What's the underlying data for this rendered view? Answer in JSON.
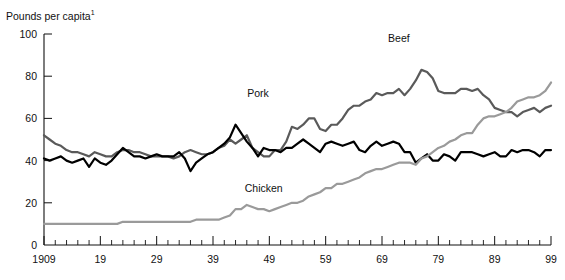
{
  "chart_data": {
    "type": "line",
    "title": "Pounds per capita",
    "title_superscript": "1",
    "xlabel": "",
    "ylabel": "Pounds per capita",
    "xlim": [
      1909,
      1999
    ],
    "ylim": [
      0,
      100
    ],
    "yticks": [
      0,
      20,
      40,
      60,
      80,
      100
    ],
    "ytick_labels": [
      "0",
      "20",
      "40",
      "60",
      "80",
      "100"
    ],
    "xticks": [
      1909,
      1919,
      1929,
      1939,
      1949,
      1959,
      1969,
      1979,
      1989,
      1999
    ],
    "xtick_labels": [
      "1909",
      "19",
      "29",
      "39",
      "49",
      "59",
      "69",
      "79",
      "89",
      "99"
    ],
    "grid": false,
    "legend": "inline-labels",
    "minor_tick_interval": 2,
    "annotations": [
      {
        "text": "Beef",
        "x": 1972,
        "y": 96
      },
      {
        "text": "Pork",
        "x": 1947,
        "y": 70
      },
      {
        "text": "Chicken",
        "x": 1948,
        "y": 25
      }
    ],
    "series": [
      {
        "name": "Beef",
        "color": "#5a5a5a",
        "width": 2.2,
        "x": [
          1909,
          1910,
          1911,
          1912,
          1913,
          1914,
          1915,
          1916,
          1917,
          1918,
          1919,
          1920,
          1921,
          1922,
          1923,
          1924,
          1925,
          1926,
          1927,
          1928,
          1929,
          1930,
          1931,
          1932,
          1933,
          1934,
          1935,
          1936,
          1937,
          1938,
          1939,
          1940,
          1941,
          1942,
          1943,
          1944,
          1945,
          1946,
          1947,
          1948,
          1949,
          1950,
          1951,
          1952,
          1953,
          1954,
          1955,
          1956,
          1957,
          1958,
          1959,
          1960,
          1961,
          1962,
          1963,
          1964,
          1965,
          1966,
          1967,
          1968,
          1969,
          1970,
          1971,
          1972,
          1973,
          1974,
          1975,
          1976,
          1977,
          1978,
          1979,
          1980,
          1981,
          1982,
          1983,
          1984,
          1985,
          1986,
          1987,
          1988,
          1989,
          1990,
          1991,
          1992,
          1993,
          1994,
          1995,
          1996,
          1997,
          1998,
          1999
        ],
        "values": [
          52,
          50,
          48,
          47,
          45,
          44,
          44,
          43,
          42,
          44,
          43,
          42,
          42,
          44,
          45,
          45,
          44,
          44,
          43,
          42,
          42,
          42,
          42,
          41,
          42,
          44,
          45,
          44,
          43,
          43,
          44,
          46,
          47,
          50,
          48,
          50,
          52,
          46,
          44,
          42,
          42,
          45,
          45,
          49,
          56,
          55,
          57,
          60,
          60,
          55,
          54,
          57,
          57,
          60,
          64,
          66,
          66,
          68,
          69,
          72,
          71,
          72,
          72,
          74,
          71,
          74,
          78,
          83,
          82,
          79,
          73,
          72,
          72,
          72,
          74,
          74,
          73,
          74,
          71,
          69,
          65,
          64,
          63,
          63,
          61,
          63,
          64,
          65,
          63,
          65,
          66
        ]
      },
      {
        "name": "Pork",
        "color": "#000000",
        "width": 2.2,
        "x": [
          1909,
          1910,
          1911,
          1912,
          1913,
          1914,
          1915,
          1916,
          1917,
          1918,
          1919,
          1920,
          1921,
          1922,
          1923,
          1924,
          1925,
          1926,
          1927,
          1928,
          1929,
          1930,
          1931,
          1932,
          1933,
          1934,
          1935,
          1936,
          1937,
          1938,
          1939,
          1940,
          1941,
          1942,
          1943,
          1944,
          1945,
          1946,
          1947,
          1948,
          1949,
          1950,
          1951,
          1952,
          1953,
          1954,
          1955,
          1956,
          1957,
          1958,
          1959,
          1960,
          1961,
          1962,
          1963,
          1964,
          1965,
          1966,
          1967,
          1968,
          1969,
          1970,
          1971,
          1972,
          1973,
          1974,
          1975,
          1976,
          1977,
          1978,
          1979,
          1980,
          1981,
          1982,
          1983,
          1984,
          1985,
          1986,
          1987,
          1988,
          1989,
          1990,
          1991,
          1992,
          1993,
          1994,
          1995,
          1996,
          1997,
          1998,
          1999
        ],
        "values": [
          41,
          40,
          41,
          42,
          40,
          39,
          40,
          41,
          37,
          41,
          39,
          38,
          40,
          43,
          46,
          44,
          42,
          42,
          41,
          42,
          43,
          42,
          42,
          42,
          44,
          41,
          35,
          39,
          41,
          43,
          44,
          46,
          48,
          51,
          57,
          53,
          49,
          46,
          42,
          46,
          45,
          45,
          44,
          46,
          46,
          48,
          50,
          48,
          46,
          44,
          48,
          49,
          48,
          47,
          48,
          49,
          45,
          44,
          47,
          49,
          47,
          48,
          49,
          48,
          44,
          44,
          39,
          41,
          43,
          40,
          40,
          43,
          42,
          40,
          44,
          44,
          44,
          43,
          42,
          43,
          44,
          42,
          42,
          45,
          44,
          45,
          45,
          44,
          42,
          45,
          45
        ]
      },
      {
        "name": "Chicken",
        "color": "#9a9a9a",
        "width": 2.2,
        "x": [
          1909,
          1910,
          1911,
          1912,
          1913,
          1914,
          1915,
          1916,
          1917,
          1918,
          1919,
          1920,
          1921,
          1922,
          1923,
          1924,
          1925,
          1926,
          1927,
          1928,
          1929,
          1930,
          1931,
          1932,
          1933,
          1934,
          1935,
          1936,
          1937,
          1938,
          1939,
          1940,
          1941,
          1942,
          1943,
          1944,
          1945,
          1946,
          1947,
          1948,
          1949,
          1950,
          1951,
          1952,
          1953,
          1954,
          1955,
          1956,
          1957,
          1958,
          1959,
          1960,
          1961,
          1962,
          1963,
          1964,
          1965,
          1966,
          1967,
          1968,
          1969,
          1970,
          1971,
          1972,
          1973,
          1974,
          1975,
          1976,
          1977,
          1978,
          1979,
          1980,
          1981,
          1982,
          1983,
          1984,
          1985,
          1986,
          1987,
          1988,
          1989,
          1990,
          1991,
          1992,
          1993,
          1994,
          1995,
          1996,
          1997,
          1998,
          1999
        ],
        "values": [
          10,
          10,
          10,
          10,
          10,
          10,
          10,
          10,
          10,
          10,
          10,
          10,
          10,
          10,
          11,
          11,
          11,
          11,
          11,
          11,
          11,
          11,
          11,
          11,
          11,
          11,
          11,
          12,
          12,
          12,
          12,
          12,
          13,
          14,
          17,
          17,
          19,
          18,
          17,
          17,
          16,
          17,
          18,
          19,
          20,
          20,
          21,
          23,
          24,
          25,
          27,
          27,
          29,
          29,
          30,
          31,
          32,
          34,
          35,
          36,
          36,
          37,
          38,
          39,
          39,
          39,
          38,
          41,
          42,
          44,
          46,
          47,
          49,
          50,
          52,
          53,
          53,
          57,
          60,
          61,
          61,
          62,
          63,
          65,
          68,
          69,
          70,
          70,
          71,
          73,
          77
        ]
      }
    ]
  }
}
